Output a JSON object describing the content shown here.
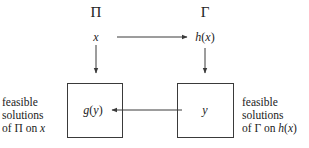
{
  "diagram": {
    "problems": {
      "left": {
        "symbol": "Π",
        "instance": "x"
      },
      "right": {
        "symbol": "Γ",
        "instance_fn": "h",
        "instance_arg": "x"
      }
    },
    "boxes": {
      "left": {
        "content_fn": "g",
        "content_arg": "y"
      },
      "right": {
        "content": "y"
      }
    },
    "captions": {
      "left": {
        "line1": "feasible",
        "line2": "solutions",
        "line3_prefix": "of Π on ",
        "line3_var": "x"
      },
      "right": {
        "line1": "feasible",
        "line2": "solutions",
        "line3_prefix": "of Γ on ",
        "line3_fn": "h",
        "line3_arg": "x"
      }
    },
    "edges": [
      {
        "from": "x",
        "to": "h(x)",
        "direction": "right"
      },
      {
        "from": "x",
        "to": "left-box",
        "direction": "down"
      },
      {
        "from": "h(x)",
        "to": "right-box",
        "direction": "down"
      },
      {
        "from": "y",
        "to": "g(y)",
        "direction": "left"
      }
    ],
    "colors": {
      "line": "#3a3a3a",
      "text": "#222222",
      "background": "#ffffff"
    }
  }
}
